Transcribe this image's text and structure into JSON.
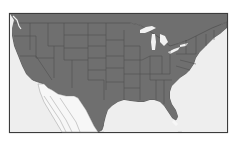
{
  "map": {
    "subject": "Contiguous United States (state boundaries)",
    "style": "grayscale, states filled gray on light water background, framed",
    "colors": {
      "page_background": "#ffffff",
      "water": "#eeeeee",
      "land_us": "#6f6f6f",
      "land_foreign": "#eeeeee",
      "state_border": "#4a4a4a",
      "frame_border": "#3c3c3c",
      "lakes": "#f2f2f2"
    },
    "frame": {
      "x": 9,
      "y": 13,
      "width": 219,
      "height": 120
    },
    "features": [
      "state-boundaries",
      "great-lakes",
      "gulf-of-mexico",
      "atlantic-ocean",
      "pacific-ocean",
      "mexico-outline"
    ]
  }
}
